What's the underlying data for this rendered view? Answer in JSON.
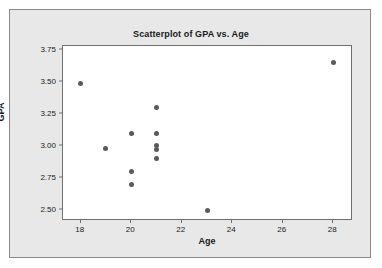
{
  "chart_data": {
    "type": "scatter",
    "title": "Scatterplot of GPA vs. Age",
    "xlabel": "Age",
    "ylabel": "GPA",
    "xlim": [
      17.3,
      28.7
    ],
    "ylim": [
      2.43,
      3.78
    ],
    "xticks": [
      18,
      20,
      22,
      24,
      26,
      28
    ],
    "xtick_labels": [
      "18",
      "20",
      "22",
      "24",
      "26",
      "28"
    ],
    "yticks": [
      2.5,
      2.75,
      3.0,
      3.25,
      3.5,
      3.75
    ],
    "ytick_labels": [
      "2.50",
      "2.75",
      "3.00",
      "3.25",
      "3.50",
      "3.75"
    ],
    "grid": false,
    "legend": false,
    "marker_color": "#5a5a5a",
    "plot_background": "#ffffff",
    "panel_background": "#e8e8e8",
    "points": [
      {
        "x": 18,
        "y": 3.49
      },
      {
        "x": 19,
        "y": 2.98
      },
      {
        "x": 20,
        "y": 3.1
      },
      {
        "x": 20,
        "y": 2.8
      },
      {
        "x": 20,
        "y": 2.7
      },
      {
        "x": 21,
        "y": 3.3
      },
      {
        "x": 21,
        "y": 3.1
      },
      {
        "x": 21,
        "y": 3.0
      },
      {
        "x": 21,
        "y": 2.97
      },
      {
        "x": 21,
        "y": 2.9
      },
      {
        "x": 23,
        "y": 2.5
      },
      {
        "x": 28,
        "y": 3.65
      }
    ]
  }
}
